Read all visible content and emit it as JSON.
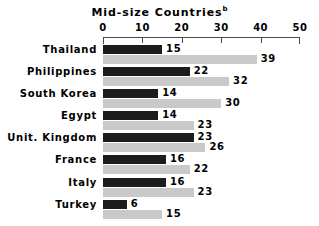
{
  "chart_data": {
    "type": "bar",
    "orientation": "horizontal",
    "title": "Mid-size Countries",
    "title_superscript": "b",
    "xlabel": "",
    "ylabel": "",
    "xlim": [
      0,
      50
    ],
    "xticks": [
      0,
      10,
      20,
      30,
      40,
      50
    ],
    "xtick_labels": [
      "0",
      "10",
      "20",
      "30",
      "40",
      "50"
    ],
    "grid": false,
    "legend": "none",
    "categories": [
      "Thailand",
      "Philippines",
      "South Korea",
      "Egypt",
      "Unit. Kingdom",
      "France",
      "Italy",
      "Turkey"
    ],
    "series": [
      {
        "name": "dark-series",
        "color": "#1c1c1c",
        "values": [
          15,
          22,
          14,
          14,
          23,
          16,
          16,
          6
        ]
      },
      {
        "name": "light-series",
        "color": "#c9c9c9",
        "values": [
          39,
          32,
          30,
          23,
          26,
          22,
          23,
          15
        ]
      }
    ],
    "data_labels": [
      {
        "category": "Thailand",
        "dark": "15",
        "light": "39"
      },
      {
        "category": "Philippines",
        "dark": "22",
        "light": "32"
      },
      {
        "category": "South Korea",
        "dark": "14",
        "light": "30"
      },
      {
        "category": "Egypt",
        "dark": "14",
        "light": "23"
      },
      {
        "category": "Unit. Kingdom",
        "dark": "23",
        "light": "26"
      },
      {
        "category": "France",
        "dark": "16",
        "light": "22"
      },
      {
        "category": "Italy",
        "dark": "16",
        "light": "23"
      },
      {
        "category": "Turkey",
        "dark": "6",
        "light": "15"
      }
    ]
  },
  "colors": {
    "background": "#ffffff",
    "text": "#000000",
    "axis": "#4a4a4a",
    "bar_dark": "#1c1c1c",
    "bar_light": "#c9c9c9"
  }
}
